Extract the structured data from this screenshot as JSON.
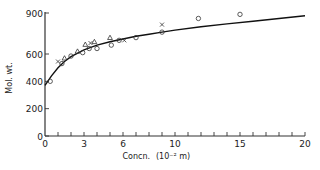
{
  "chart_data": {
    "type": "scatter",
    "title": "",
    "xlabel": "Concn.",
    "xlabel_unit": "(10⁻² m)",
    "ylabel": "Mol. wt.",
    "xlim": [
      0,
      20
    ],
    "ylim": [
      0,
      900
    ],
    "grid": false,
    "x_ticks_labeled": [
      0,
      3,
      6,
      10,
      15,
      20
    ],
    "x_tick_labels": [
      "0",
      "3",
      "6",
      "10",
      "15",
      "20"
    ],
    "x_minor_tick_step": 1,
    "y_ticks": [
      0,
      200,
      400,
      600,
      900
    ],
    "y_tick_labels": [
      "0",
      "200",
      "400",
      "600",
      "900"
    ],
    "legend": "none",
    "series": [
      {
        "name": "circles",
        "marker": "circle",
        "points": [
          [
            0.4,
            400
          ],
          [
            1.3,
            530
          ],
          [
            2.0,
            585
          ],
          [
            2.9,
            610
          ],
          [
            3.4,
            640
          ],
          [
            4.0,
            640
          ],
          [
            5.1,
            665
          ],
          [
            5.7,
            700
          ],
          [
            7.0,
            720
          ],
          [
            9.0,
            760
          ],
          [
            11.8,
            860
          ],
          [
            15.0,
            890
          ]
        ]
      },
      {
        "name": "triangles",
        "marker": "triangle",
        "points": [
          [
            1.5,
            570
          ],
          [
            2.5,
            620
          ],
          [
            3.1,
            670
          ],
          [
            3.8,
            690
          ],
          [
            5.0,
            720
          ]
        ]
      },
      {
        "name": "crosses",
        "marker": "x",
        "points": [
          [
            1.0,
            545
          ],
          [
            3.5,
            680
          ],
          [
            6.1,
            700
          ],
          [
            9.0,
            815
          ]
        ]
      },
      {
        "name": "fitted-curve",
        "marker": "line",
        "points": [
          [
            0,
            370
          ],
          [
            0.5,
            440
          ],
          [
            1,
            500
          ],
          [
            1.5,
            545
          ],
          [
            2,
            580
          ],
          [
            3,
            630
          ],
          [
            4,
            665
          ],
          [
            5,
            690
          ],
          [
            6,
            710
          ],
          [
            7,
            730
          ],
          [
            8,
            745
          ],
          [
            9,
            760
          ],
          [
            10,
            775
          ],
          [
            12,
            800
          ],
          [
            14,
            820
          ],
          [
            16,
            840
          ],
          [
            18,
            860
          ],
          [
            20,
            880
          ]
        ]
      }
    ]
  }
}
